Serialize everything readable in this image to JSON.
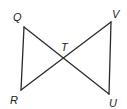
{
  "diagram": {
    "type": "geometry",
    "points": {
      "Q": {
        "label": "Q",
        "x": 24,
        "y": 27
      },
      "R": {
        "label": "R",
        "x": 21,
        "y": 90
      },
      "V": {
        "label": "V",
        "x": 111,
        "y": 22
      },
      "U": {
        "label": "U",
        "x": 109,
        "y": 94
      },
      "T": {
        "label": "T",
        "x": 64,
        "y": 58
      }
    },
    "segments": [
      [
        "Q",
        "R"
      ],
      [
        "Q",
        "U"
      ],
      [
        "R",
        "V"
      ],
      [
        "V",
        "U"
      ]
    ],
    "colors": {
      "line": "#2a2a2a",
      "label": "#222222",
      "background": "#ffffff"
    }
  }
}
